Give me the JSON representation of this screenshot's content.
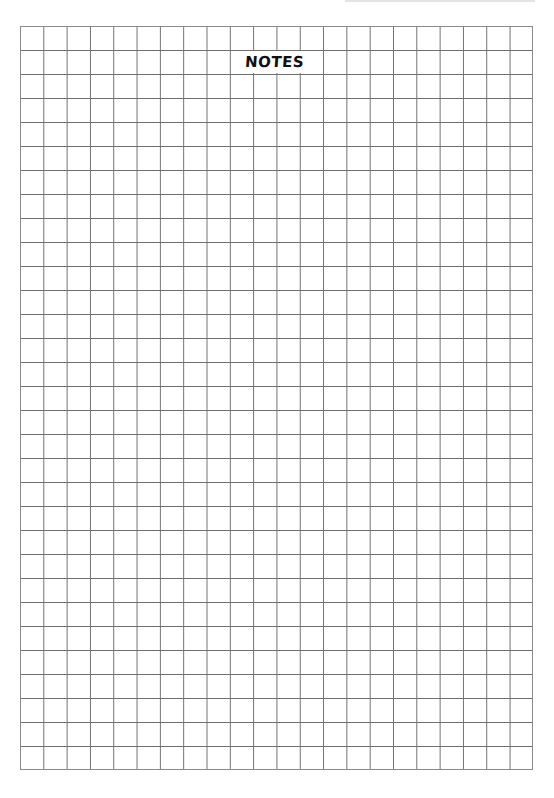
{
  "page": {
    "title": "NOTES",
    "grid": {
      "columns": 22,
      "rows": 31,
      "line_color": "#6f6f6f",
      "background": "#ffffff"
    }
  }
}
